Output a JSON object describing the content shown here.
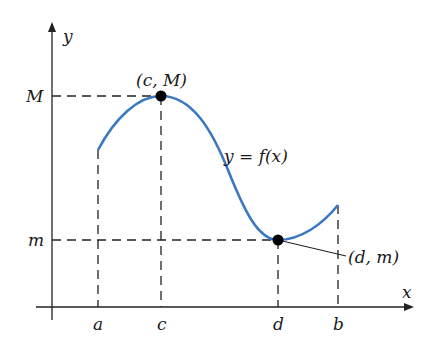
{
  "axes": {
    "x_label": "x",
    "y_label": "y"
  },
  "tick_labels": {
    "a": "a",
    "c": "c",
    "d": "d",
    "b": "b",
    "M": "M",
    "m": "m"
  },
  "annotations": {
    "max_point": "(c, M)",
    "min_point": "(d, m)",
    "function": "y = f(x)"
  },
  "colors": {
    "curve": "#3a78c2",
    "axes": "#222222",
    "points": "#000000"
  }
}
